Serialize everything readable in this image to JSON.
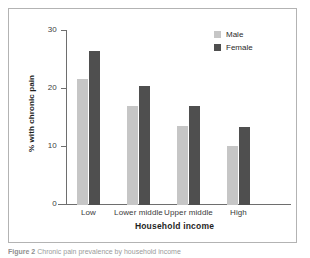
{
  "figure": {
    "caption_label": "Figure 2",
    "caption_text": "Chronic pain prevalence by household income"
  },
  "legend": {
    "position": "top-right",
    "entries": [
      {
        "label": "Male",
        "color": "#c6c6c6"
      },
      {
        "label": "Female",
        "color": "#4f4f4f"
      }
    ]
  },
  "axes": {
    "y_ticks": [
      "0",
      "10",
      "20",
      "30"
    ],
    "y_title": "% with chronic pain",
    "x_title": "Household income"
  },
  "chart_data": {
    "type": "bar",
    "title": "",
    "subtitle": "",
    "xlabel": "Household income",
    "ylabel": "% with chronic pain",
    "categories": [
      "Low",
      "Lower middle",
      "Upper middle",
      "High"
    ],
    "series": [
      {
        "name": "Male",
        "color": "#c6c6c6",
        "values": [
          21.8,
          17.0,
          13.6,
          10.2
        ]
      },
      {
        "name": "Female",
        "color": "#4f4f4f",
        "values": [
          26.5,
          20.5,
          17.0,
          13.5
        ]
      }
    ],
    "ylim": [
      0,
      30
    ],
    "yticks": [
      0,
      10,
      20,
      30
    ],
    "grid": false,
    "legend_position": "top-right",
    "annotations": []
  }
}
